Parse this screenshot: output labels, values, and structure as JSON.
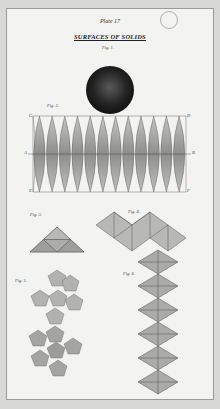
{
  "plate": {
    "number_label": "Plate 17",
    "title": "SURFACES OF SOLIDS"
  },
  "figures": [
    {
      "label": "Fig. 1.",
      "subject": "sphere"
    },
    {
      "label": "Fig. 2.",
      "subject": "sphere gores",
      "corner_labels": [
        "C",
        "D",
        "A",
        "B",
        "E",
        "F"
      ],
      "gore_count": 12
    },
    {
      "label": "Fig. 3.",
      "subject": "tetrahedron net"
    },
    {
      "label": "Fig. 4.",
      "subject": "octahedron net"
    },
    {
      "label": "Fig. 5.",
      "subject": "dodecahedron net"
    },
    {
      "label": "Fig. 6.",
      "subject": "icosahedron net"
    }
  ],
  "colors": {
    "paper": "#f3f3f1",
    "background": "#d8d8d6",
    "fill": "#a9a9a6",
    "sphere": "#1e1e1e"
  }
}
